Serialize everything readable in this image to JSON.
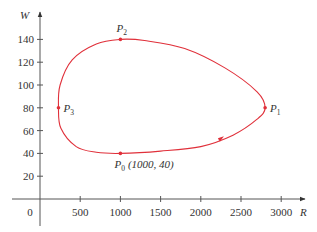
{
  "chart_data": {
    "type": "line",
    "title": "",
    "xlabel": "R",
    "ylabel": "W",
    "xlim": [
      0,
      3200
    ],
    "ylim": [
      0,
      150
    ],
    "x_ticks": [
      500,
      1000,
      1500,
      2000,
      2500,
      3000
    ],
    "y_ticks": [
      20,
      40,
      60,
      80,
      100,
      120,
      140
    ],
    "origin_label": "0",
    "grid": false,
    "legend": null,
    "curve": {
      "description": "closed counterclockwise phase trajectory",
      "color": "#e0303a",
      "x": [
        1000,
        1500,
        2000,
        2400,
        2700,
        2800,
        2700,
        2300,
        1800,
        1300,
        1000,
        700,
        400,
        250,
        230,
        260,
        450,
        700,
        1000
      ],
      "y": [
        40,
        42,
        46,
        56,
        70,
        80,
        94,
        115,
        132,
        139,
        140,
        136,
        122,
        100,
        80,
        62,
        46,
        41,
        40
      ]
    },
    "direction_arrow": {
      "x": 2250,
      "y": 52,
      "heading": "right"
    },
    "points": [
      {
        "name": "P",
        "sub": "0",
        "x": 1000,
        "y": 40,
        "annotation": "(1000, 40)"
      },
      {
        "name": "P",
        "sub": "1",
        "x": 2800,
        "y": 80,
        "annotation": ""
      },
      {
        "name": "P",
        "sub": "2",
        "x": 1000,
        "y": 140,
        "annotation": ""
      },
      {
        "name": "P",
        "sub": "3",
        "x": 230,
        "y": 80,
        "annotation": ""
      }
    ]
  }
}
